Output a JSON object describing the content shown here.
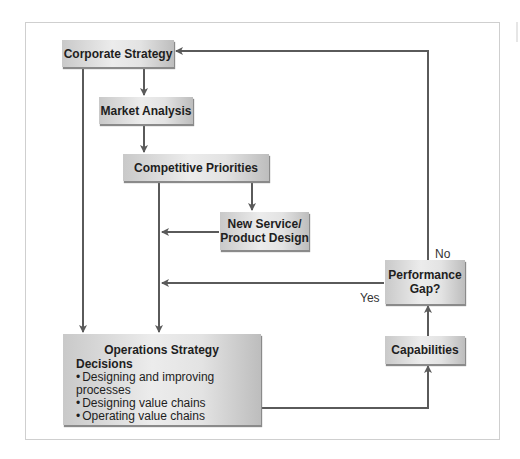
{
  "diagram": {
    "type": "flowchart",
    "nodes": {
      "corporate_strategy": "Corporate Strategy",
      "market_analysis": "Market Analysis",
      "competitive_priorities": "Competitive Priorities",
      "new_service_design": [
        "New Service/",
        "Product Design"
      ],
      "performance_gap": [
        "Performance",
        "Gap?"
      ],
      "capabilities": "Capabilities",
      "operations_strategy": {
        "title": "Operations Strategy",
        "subtitle": "Decisions",
        "items": [
          "Designing and improving processes",
          "Designing value chains",
          "Operating value chains"
        ]
      }
    },
    "edge_labels": {
      "no": "No",
      "yes": "Yes"
    },
    "edges": [
      {
        "from": "Corporate Strategy",
        "to": "Market Analysis"
      },
      {
        "from": "Market Analysis",
        "to": "Competitive Priorities"
      },
      {
        "from": "Competitive Priorities",
        "to": "New Service/Product Design"
      },
      {
        "from": "New Service/Product Design",
        "to": "Operations Strategy"
      },
      {
        "from": "Competitive Priorities",
        "to": "Operations Strategy"
      },
      {
        "from": "Corporate Strategy",
        "to": "Operations Strategy"
      },
      {
        "from": "Operations Strategy",
        "to": "Capabilities"
      },
      {
        "from": "Capabilities",
        "to": "Performance Gap?"
      },
      {
        "from": "Performance Gap?",
        "to": "Operations Strategy",
        "label": "Yes"
      },
      {
        "from": "Performance Gap?",
        "to": "Corporate Strategy",
        "label": "No"
      }
    ],
    "colors": {
      "line": "#5a5a5a",
      "box_light": "#ececec",
      "box_dark": "#bdbdbd",
      "frame": "#cfcfcf"
    }
  }
}
